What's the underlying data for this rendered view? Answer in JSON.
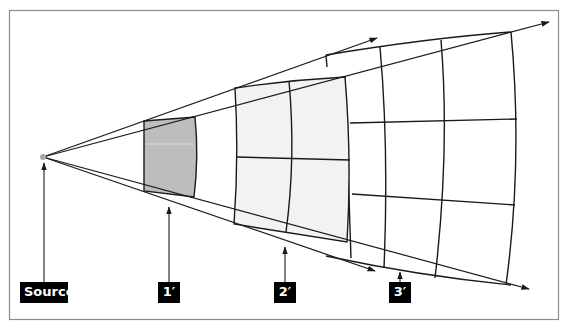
{
  "diagram": {
    "title": "",
    "colors": {
      "frame": "#8a8a8a",
      "line": "#1a1a1a",
      "source_dot": "#a8a8a8",
      "box1_fill": "#bdbdbd",
      "box2_fill": "#f2f2f2",
      "grid3_fill": "#ffffff",
      "label_bg": "#000000",
      "label_text": "#ffffff"
    },
    "labels": {
      "source": "Source",
      "one": "1′",
      "two": "2′",
      "three": "3′"
    },
    "elements": [
      {
        "id": "source",
        "description": "Point source emitting diverging rays"
      },
      {
        "id": "1'",
        "description": "Single shaded area element (1×1) at distance 1"
      },
      {
        "id": "2'",
        "description": "2×2 grid of area elements at distance 2"
      },
      {
        "id": "3'",
        "description": "3×3 grid of area elements at distance 3"
      }
    ]
  }
}
